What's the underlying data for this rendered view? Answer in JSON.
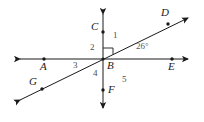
{
  "figure": {
    "stroke_color": "#1a1a1a",
    "label_color": "#1a1a1a",
    "number_color": "#4a4a4a",
    "background": "#ffffff"
  },
  "points": [
    {
      "id": "A",
      "label": "A",
      "x": 44,
      "y": 59,
      "label_x": 40,
      "label_y": 63,
      "dot": true
    },
    {
      "id": "B",
      "label": "B",
      "x": 103,
      "y": 59,
      "label_x": 106,
      "label_y": 61,
      "dot": false
    },
    {
      "id": "C",
      "label": "C",
      "x": 103,
      "y": 32,
      "label_x": 92,
      "label_y": 22,
      "dot": true
    },
    {
      "id": "D",
      "label": "D",
      "x": 172,
      "y": 26,
      "label_x": 163,
      "label_y": 8,
      "dot": true
    },
    {
      "id": "E",
      "label": "E",
      "x": 172,
      "y": 59,
      "label_x": 169,
      "label_y": 63,
      "dot": true
    },
    {
      "id": "F",
      "label": "F",
      "x": 103,
      "y": 91,
      "label_x": 107,
      "label_y": 86,
      "dot": true
    },
    {
      "id": "G",
      "label": "G",
      "x": 41,
      "y": 89,
      "label_x": 30,
      "label_y": 78,
      "dot": true
    }
  ],
  "lines": [
    {
      "id": "line-AE",
      "name": "horizontal-line-AE",
      "x1": 14,
      "y1": 59,
      "x2": 194,
      "y2": 59,
      "arrow_start": true,
      "arrow_end": true
    },
    {
      "id": "line-CF",
      "name": "vertical-line-CF",
      "x1": 103,
      "y1": 8,
      "x2": 103,
      "y2": 114,
      "arrow_start": true,
      "arrow_end": true
    },
    {
      "id": "line-GD",
      "name": "diagonal-line-GD",
      "x1": 14,
      "y1": 103,
      "x2": 194,
      "y2": 15,
      "arrow_start": true,
      "arrow_end": true
    }
  ],
  "angles": [
    {
      "id": "angle-1",
      "label": "1",
      "x": 113,
      "y": 32,
      "region": "between ray BC and ray BD"
    },
    {
      "id": "angle-2",
      "label": "2",
      "x": 90,
      "y": 44,
      "region": "between ray BC and ray BA"
    },
    {
      "id": "angle-3",
      "label": "3",
      "x": 73,
      "y": 62,
      "region": "between ray BA and ray BG"
    },
    {
      "id": "angle-4",
      "label": "4",
      "x": 93,
      "y": 70,
      "region": "between ray BG and ray BF"
    },
    {
      "id": "angle-5",
      "label": "5",
      "x": 122,
      "y": 76,
      "region": "between ray BF and ray BE"
    }
  ],
  "angle_measures": [
    {
      "id": "angle-DBE",
      "label": "26°",
      "value": 26,
      "unit": "degrees",
      "x": 137,
      "y": 43,
      "region": "between ray BD and ray BE"
    }
  ],
  "right_angle_marks": [
    {
      "id": "right-angle-CBD",
      "vertex": "B",
      "size": 10,
      "note": "square marker indicating 90 degrees between ray BC and ray BD"
    }
  ]
}
